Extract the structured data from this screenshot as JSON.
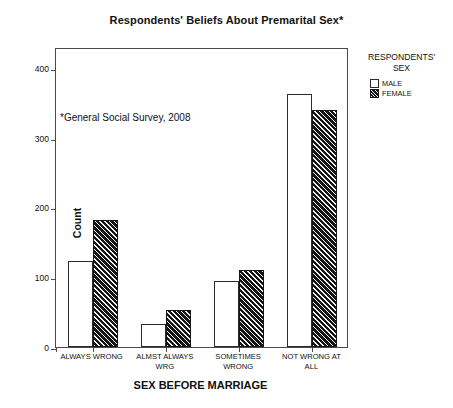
{
  "chart_data": {
    "type": "bar",
    "title": "Respondents' Beliefs About Premarital Sex*",
    "xlabel": "SEX BEFORE MARRIAGE",
    "ylabel": "Count",
    "categories": [
      "ALWAYS WRONG",
      "ALMST ALWAYS WRG",
      "SOMETIMES WRONG",
      "NOT WRONG AT ALL"
    ],
    "series": [
      {
        "name": "MALE",
        "values": [
          123,
          33,
          94,
          362
        ]
      },
      {
        "name": "FEMALE",
        "values": [
          182,
          53,
          111,
          340
        ]
      }
    ],
    "ylim": [
      0,
      430
    ],
    "yticks": [
      0,
      100,
      200,
      300,
      400
    ],
    "ytick_labels": [
      "0",
      "100",
      "200",
      "300",
      "400"
    ],
    "grid": false,
    "legend_position": "right",
    "annotation": "*General Social Survey, 2008"
  },
  "legend": {
    "title": "RESPONDENTS'\nSEX",
    "entries": [
      {
        "label": "MALE",
        "pattern": "solid-white"
      },
      {
        "label": "FEMALE",
        "pattern": "diagonal-hatch-dark"
      }
    ]
  },
  "colors": {
    "male_fill": "#ffffff",
    "female_fill": "#141414",
    "axis": "#4a4a4a",
    "text": "#111111",
    "background": "#ffffff"
  }
}
